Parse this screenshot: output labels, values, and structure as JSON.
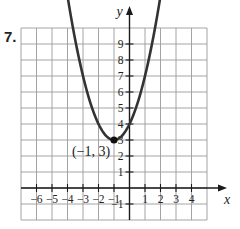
{
  "problem": {
    "number": "7."
  },
  "chart_data": {
    "type": "line",
    "title": "",
    "function": "y = (x + 1)^2 + 3",
    "xlabel": "x",
    "ylabel": "y",
    "xlim": [
      -7,
      5
    ],
    "ylim": [
      -2,
      10
    ],
    "grid": true,
    "x_ticks": [
      -6,
      -5,
      -4,
      -3,
      -2,
      -1,
      1,
      2,
      3,
      4
    ],
    "y_ticks": [
      -1,
      1,
      2,
      3,
      4,
      5,
      6,
      7,
      8,
      9
    ],
    "series": [
      {
        "name": "parabola",
        "x": [
          -4.5,
          -4,
          -3.5,
          -3,
          -2.5,
          -2,
          -1.5,
          -1,
          -0.5,
          0,
          0.5,
          1,
          1.5,
          2,
          2.5
        ],
        "y": [
          15.25,
          12,
          9.25,
          7,
          5.25,
          4,
          3.25,
          3,
          3.25,
          4,
          5.25,
          7,
          9.25,
          12,
          15.25
        ],
        "visible_range_x": [
          -4.4,
          2.4
        ],
        "arrows": "both ends"
      }
    ],
    "annotations": [
      {
        "text": "(−1, 3)",
        "x": -1,
        "y": 3,
        "marker": "filled-dot"
      }
    ],
    "color": "#333333"
  }
}
